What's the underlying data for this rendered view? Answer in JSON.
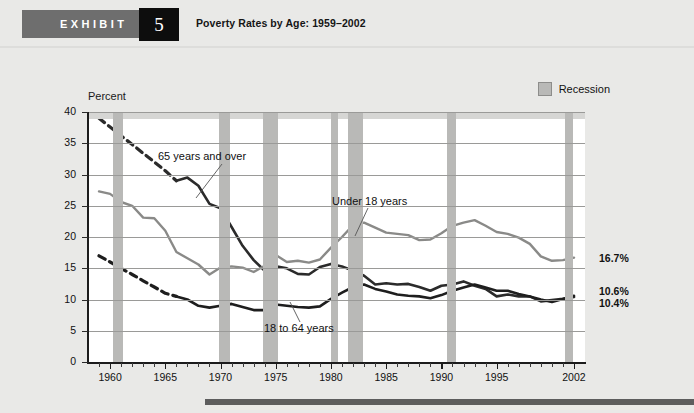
{
  "header": {
    "exhibit_label": "EXHIBIT",
    "exhibit_number": "5",
    "title": "Poverty Rates by Age: 1959–2002"
  },
  "legend": {
    "recession_label": "Recession",
    "recession_color": "#b9b9b7"
  },
  "annotations": {
    "over65": "65 years and over",
    "under18": "Under 18 years",
    "adults": "18 to 64 years"
  },
  "end_labels": {
    "under18": "16.7%",
    "adults": "10.6%",
    "over65": "10.4%"
  },
  "chart_data": {
    "type": "line",
    "title": "Poverty Rates by Age: 1959–2002",
    "xlabel": "",
    "ylabel": "Percent",
    "xlim": [
      1958,
      2003
    ],
    "ylim": [
      0,
      40
    ],
    "ytick_values": [
      0,
      5,
      10,
      15,
      20,
      25,
      30,
      35,
      40
    ],
    "xtick_values": [
      1960,
      1965,
      1970,
      1975,
      1980,
      1985,
      1990,
      1995,
      2002
    ],
    "xtick_labels": [
      "1960",
      "1965",
      "1970",
      "1975",
      "1980",
      "1985",
      "1990",
      "1995",
      "2002"
    ],
    "grid": "horizontal",
    "legend_position": "top-right",
    "recession_bands": [
      {
        "start": 1960.3,
        "end": 1961.2
      },
      {
        "start": 1969.9,
        "end": 1970.9
      },
      {
        "start": 1973.8,
        "end": 1975.2
      },
      {
        "start": 1980.0,
        "end": 1980.6
      },
      {
        "start": 1981.5,
        "end": 1982.9
      },
      {
        "start": 1990.5,
        "end": 1991.3
      },
      {
        "start": 2001.2,
        "end": 2001.9
      }
    ],
    "series": [
      {
        "name": "65 years and over",
        "color": "#2b2b2b",
        "style": "dashed-then-solid",
        "dashed_until": 1966,
        "x": [
          1959,
          1960,
          1961,
          1962,
          1963,
          1964,
          1965,
          1966,
          1967,
          1968,
          1969,
          1970,
          1971,
          1972,
          1973,
          1974,
          1975,
          1976,
          1977,
          1978,
          1979,
          1980,
          1981,
          1982,
          1983,
          1984,
          1985,
          1986,
          1987,
          1988,
          1989,
          1990,
          1991,
          1992,
          1993,
          1994,
          1995,
          1996,
          1997,
          1998,
          1999,
          2000,
          2001,
          2002
        ],
        "values": [
          39.0,
          37.6,
          36.2,
          34.8,
          33.4,
          32.0,
          30.6,
          29.0,
          29.5,
          28.2,
          25.3,
          24.6,
          21.6,
          18.6,
          16.3,
          14.6,
          15.3,
          15.0,
          14.1,
          14.0,
          15.2,
          15.7,
          15.3,
          14.6,
          13.8,
          12.4,
          12.6,
          12.4,
          12.5,
          12.0,
          11.4,
          12.2,
          12.4,
          12.9,
          12.2,
          11.7,
          10.5,
          10.8,
          10.5,
          10.5,
          9.7,
          9.9,
          10.1,
          10.4
        ]
      },
      {
        "name": "Under 18 years",
        "color": "#8a8a88",
        "style": "solid",
        "x": [
          1959,
          1960,
          1961,
          1962,
          1963,
          1964,
          1965,
          1966,
          1967,
          1968,
          1969,
          1970,
          1971,
          1972,
          1973,
          1974,
          1975,
          1976,
          1977,
          1978,
          1979,
          1980,
          1981,
          1982,
          1983,
          1984,
          1985,
          1986,
          1987,
          1988,
          1989,
          1990,
          1991,
          1992,
          1993,
          1994,
          1995,
          1996,
          1997,
          1998,
          1999,
          2000,
          2001,
          2002
        ],
        "values": [
          27.3,
          26.9,
          25.6,
          25.0,
          23.1,
          23.0,
          21.0,
          17.6,
          16.6,
          15.6,
          14.0,
          15.1,
          15.3,
          15.1,
          14.4,
          15.4,
          17.1,
          16.0,
          16.2,
          15.9,
          16.4,
          18.3,
          20.0,
          21.9,
          22.3,
          21.5,
          20.7,
          20.5,
          20.3,
          19.5,
          19.6,
          20.6,
          21.8,
          22.3,
          22.7,
          21.8,
          20.8,
          20.5,
          19.9,
          18.9,
          16.9,
          16.2,
          16.3,
          16.7
        ]
      },
      {
        "name": "18 to 64 years",
        "color": "#1e1e1e",
        "style": "dashed-then-solid",
        "dashed_until": 1966,
        "x": [
          1959,
          1960,
          1961,
          1962,
          1963,
          1964,
          1965,
          1966,
          1967,
          1968,
          1969,
          1970,
          1971,
          1972,
          1973,
          1974,
          1975,
          1976,
          1977,
          1978,
          1979,
          1980,
          1981,
          1982,
          1983,
          1984,
          1985,
          1986,
          1987,
          1988,
          1989,
          1990,
          1991,
          1992,
          1993,
          1994,
          1995,
          1996,
          1997,
          1998,
          1999,
          2000,
          2001,
          2002
        ],
        "values": [
          17.0,
          16.0,
          15.0,
          14.0,
          13.0,
          12.0,
          11.0,
          10.5,
          10.0,
          9.0,
          8.7,
          9.0,
          9.3,
          8.8,
          8.3,
          8.3,
          9.2,
          9.0,
          8.8,
          8.7,
          8.9,
          10.1,
          11.1,
          12.0,
          12.4,
          11.7,
          11.3,
          10.8,
          10.6,
          10.5,
          10.2,
          10.7,
          11.4,
          11.9,
          12.4,
          11.9,
          11.4,
          11.4,
          10.9,
          10.5,
          10.0,
          9.6,
          10.1,
          10.6
        ]
      }
    ]
  }
}
